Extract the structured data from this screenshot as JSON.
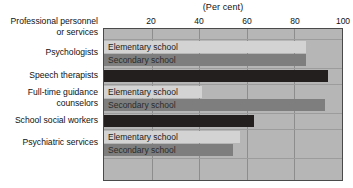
{
  "chart_data": {
    "type": "bar",
    "orientation": "horizontal",
    "title": "(Per cent)",
    "xlabel": "",
    "ylabel": "",
    "xlim": [
      0,
      100
    ],
    "ticks": [
      20,
      40,
      60,
      80,
      100
    ],
    "tick_labels": [
      "20",
      "40",
      "60",
      "80",
      "100"
    ],
    "grid": true,
    "legend": "inline-bar-labels",
    "axis_header": "Professional personnel or services",
    "series_names": [
      "Elementary school",
      "Secondary school"
    ],
    "categories": [
      "Psychologists",
      "Speech therapists",
      "Full-time guidance counselors",
      "School social workers",
      "Psychiatric services"
    ],
    "groups": [
      {
        "category": "Psychologists",
        "bars": [
          {
            "series": "Elementary school",
            "label": "Elementary school",
            "value": 85,
            "style": "elementary"
          },
          {
            "series": "Secondary school",
            "label": "Secondary school",
            "value": 85,
            "style": "secondary"
          }
        ]
      },
      {
        "category": "Speech therapists",
        "bars": [
          {
            "series": "Combined",
            "label": "",
            "value": 94,
            "style": "solid"
          }
        ]
      },
      {
        "category": "Full-time guidance counselors",
        "bars": [
          {
            "series": "Elementary school",
            "label": "Elementary school",
            "value": 41,
            "style": "elementary"
          },
          {
            "series": "Secondary school",
            "label": "Secondary school",
            "value": 93,
            "style": "secondary"
          }
        ]
      },
      {
        "category": "School social workers",
        "bars": [
          {
            "series": "Combined",
            "label": "",
            "value": 63,
            "style": "solid"
          }
        ]
      },
      {
        "category": "Psychiatric services",
        "bars": [
          {
            "series": "Elementary school",
            "label": "Elementary school",
            "value": 57,
            "style": "elementary"
          },
          {
            "series": "Secondary school",
            "label": "Secondary school",
            "value": 54,
            "style": "secondary"
          }
        ]
      }
    ],
    "colors": {
      "plot_background": "#b6b6b6",
      "elementary": "#d3d3d3",
      "secondary": "#7e7e7e",
      "solid": "#241f1f",
      "gridline": "#8d8d8d",
      "border": "#4a4a4a",
      "text": "#111111"
    }
  },
  "axis": {
    "header_line1": "Professional personnel",
    "header_line2": "or services"
  },
  "category_labels": [
    {
      "lines": [
        "Psychologists"
      ]
    },
    {
      "lines": [
        "Speech therapists"
      ]
    },
    {
      "lines": [
        "Full-time guidance",
        "counselors"
      ]
    },
    {
      "lines": [
        "School social workers"
      ]
    },
    {
      "lines": [
        "Psychiatric services"
      ]
    }
  ]
}
